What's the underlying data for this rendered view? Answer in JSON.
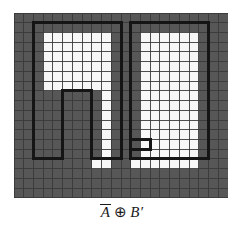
{
  "figure": {
    "caption": {
      "operand_a": "A",
      "operand_a_overbar": true,
      "operator": "⊕",
      "operand_b": "B",
      "operand_b_prime": "′",
      "full_text": "A̅ ⊕ B′"
    },
    "panel": {
      "x": 14,
      "y": 13,
      "width": 214,
      "height": 185,
      "cols": 22,
      "rows": 19,
      "cell_size": 9.73
    },
    "colors": {
      "background_grid": "#575757",
      "grid_line": "#3a3a3a",
      "filled_cell": "#f7f7f7",
      "outline": "#151515",
      "page_background": "#ffffff",
      "caption_text": "#1a1a1a"
    },
    "outline_stroke_width": 3,
    "chart_data": {
      "type": "heatmap",
      "title": "A̅ ⊕ B′",
      "xlabel": "",
      "ylabel": "",
      "grid": true,
      "legend": "none",
      "cols": 22,
      "rows": 19,
      "value_legend": {
        "0": "background (gray cell)",
        "1": "foreground (white cell)"
      },
      "filled_cells": [
        {
          "row": 2,
          "cols": [
            3,
            4,
            5,
            6,
            7,
            8,
            9
          ]
        },
        {
          "row": 3,
          "cols": [
            3,
            4,
            5,
            6,
            7,
            8,
            9
          ]
        },
        {
          "row": 4,
          "cols": [
            3,
            4,
            5,
            6,
            7,
            8,
            9
          ]
        },
        {
          "row": 5,
          "cols": [
            3,
            4,
            5,
            6,
            7,
            8,
            9
          ]
        },
        {
          "row": 6,
          "cols": [
            3,
            4,
            5,
            6,
            7,
            8,
            9
          ]
        },
        {
          "row": 7,
          "cols": [
            3,
            4,
            5,
            6,
            7,
            8,
            9
          ]
        },
        {
          "row": 2,
          "cols": [
            13,
            14,
            15,
            16,
            17,
            18
          ]
        },
        {
          "row": 3,
          "cols": [
            13,
            14,
            15,
            16,
            17,
            18
          ]
        },
        {
          "row": 4,
          "cols": [
            13,
            14,
            15,
            16,
            17,
            18
          ]
        },
        {
          "row": 5,
          "cols": [
            13,
            14,
            15,
            16,
            17,
            18
          ]
        },
        {
          "row": 6,
          "cols": [
            13,
            14,
            15,
            16,
            17,
            18
          ]
        },
        {
          "row": 7,
          "cols": [
            13,
            14,
            15,
            16,
            17,
            18
          ]
        },
        {
          "row": 8,
          "cols": [
            9,
            13,
            14,
            15,
            16,
            17,
            18
          ]
        },
        {
          "row": 9,
          "cols": [
            9,
            13,
            14,
            15,
            16,
            17,
            18
          ]
        },
        {
          "row": 10,
          "cols": [
            9,
            13,
            14,
            15,
            16,
            17,
            18
          ]
        },
        {
          "row": 11,
          "cols": [
            9,
            13,
            14,
            15,
            16,
            17,
            18
          ]
        },
        {
          "row": 12,
          "cols": [
            9,
            13,
            14,
            15,
            16,
            17,
            18
          ]
        },
        {
          "row": 13,
          "cols": [
            9,
            13,
            14,
            15,
            16,
            17,
            18
          ]
        },
        {
          "row": 14,
          "cols": [
            9,
            13,
            14,
            15,
            16,
            17,
            18
          ]
        },
        {
          "row": 15,
          "cols": [
            8,
            9,
            12,
            13,
            14,
            15,
            16,
            17,
            18
          ]
        }
      ],
      "outline_paths": [
        {
          "name": "left-inverted-u",
          "points": [
            [
              11,
              1
            ],
            [
              2,
              1
            ],
            [
              2,
              15
            ],
            [
              5,
              15
            ],
            [
              5,
              8
            ],
            [
              8,
              8
            ],
            [
              8,
              15
            ],
            [
              11,
              15
            ],
            [
              11,
              1
            ]
          ]
        },
        {
          "name": "right-rectangle",
          "points": [
            [
              12,
              1
            ],
            [
              20,
              1
            ],
            [
              20,
              15
            ],
            [
              12,
              15
            ],
            [
              12,
              13
            ],
            [
              14,
              13
            ],
            [
              14,
              14
            ],
            [
              12,
              14
            ],
            [
              12,
              1
            ]
          ]
        }
      ]
    }
  }
}
